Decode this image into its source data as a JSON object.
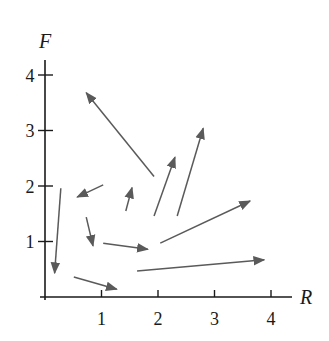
{
  "diagram": {
    "type": "direction_field",
    "axes": {
      "x_label": "R",
      "y_label": "F",
      "x_ticks": [
        "1",
        "2",
        "3",
        "4"
      ],
      "y_ticks": [
        "1",
        "2",
        "3",
        "4"
      ]
    },
    "vector_color": "#5a5a5a",
    "axis_color": "#1a1a1a",
    "vectors": [
      {
        "from": [
          1.93,
          2.17
        ],
        "to": [
          0.73,
          3.68
        ]
      },
      {
        "from": [
          1.93,
          1.46
        ],
        "to": [
          2.3,
          2.52
        ]
      },
      {
        "from": [
          2.34,
          1.46
        ],
        "to": [
          2.8,
          3.04
        ]
      },
      {
        "from": [
          1.43,
          1.55
        ],
        "to": [
          1.54,
          1.97
        ]
      },
      {
        "from": [
          1.03,
          2.02
        ],
        "to": [
          0.57,
          1.8
        ]
      },
      {
        "from": [
          0.28,
          1.96
        ],
        "to": [
          0.17,
          0.43
        ]
      },
      {
        "from": [
          0.73,
          1.44
        ],
        "to": [
          0.85,
          0.92
        ]
      },
      {
        "from": [
          1.03,
          0.97
        ],
        "to": [
          1.82,
          0.86
        ]
      },
      {
        "from": [
          0.51,
          0.36
        ],
        "to": [
          1.27,
          0.14
        ]
      },
      {
        "from": [
          2.04,
          0.97
        ],
        "to": [
          3.63,
          1.73
        ]
      },
      {
        "from": [
          1.63,
          0.47
        ],
        "to": [
          3.88,
          0.67
        ]
      }
    ]
  }
}
